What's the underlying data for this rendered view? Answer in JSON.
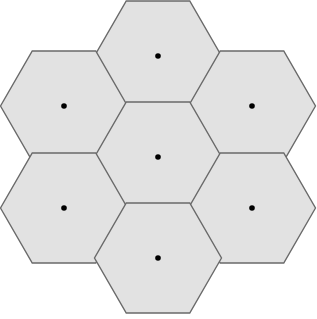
{
  "figure": {
    "name": "hexagonal-tiling-diagram",
    "canvas": {
      "width": 317,
      "height": 319,
      "background": "#ffffff"
    },
    "style": {
      "cell_fill": "#e2e2e2",
      "cell_stroke": "#6a6a6a",
      "cell_stroke_width": 1.4,
      "center_dot_color": "#000000",
      "center_dot_radius": 2.8
    },
    "geometry": {
      "orientation": "flat-top",
      "circumradius": 63.5,
      "inradius": 50.5,
      "cell_count": 7,
      "horizontal_spacing": 95.25,
      "vertical_spacing": 101,
      "bounds": {
        "left": 7,
        "top": 3,
        "right": 305,
        "bottom": 309
      }
    },
    "cells": [
      {
        "id": "hex-top",
        "label": "top",
        "cx": 158,
        "cy": 56,
        "axial_q": 0,
        "axial_r": -1,
        "dot": true
      },
      {
        "id": "hex-upper-left",
        "label": "upper-left",
        "cx": 64,
        "cy": 106,
        "axial_q": -1,
        "axial_r": 0,
        "dot": true
      },
      {
        "id": "hex-upper-right",
        "label": "upper-right",
        "cx": 252,
        "cy": 106,
        "axial_q": 1,
        "axial_r": -1,
        "dot": true
      },
      {
        "id": "hex-center",
        "label": "center",
        "cx": 158,
        "cy": 157,
        "axial_q": 0,
        "axial_r": 0,
        "dot": true
      },
      {
        "id": "hex-lower-left",
        "label": "lower-left",
        "cx": 64,
        "cy": 208,
        "axial_q": -1,
        "axial_r": 1,
        "dot": true
      },
      {
        "id": "hex-lower-right",
        "label": "lower-right",
        "cx": 252,
        "cy": 208,
        "axial_q": 1,
        "axial_r": 0,
        "dot": true
      },
      {
        "id": "hex-bottom",
        "label": "bottom",
        "cx": 158,
        "cy": 258,
        "axial_q": 0,
        "axial_r": 1,
        "dot": true
      }
    ]
  }
}
